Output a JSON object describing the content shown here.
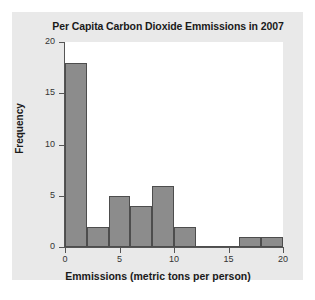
{
  "chart_data": {
    "type": "bar",
    "title": "Per Capita Carbon Dioxide Emmissions in 2007",
    "xlabel": "Emmissions (metric tons per person)",
    "ylabel": "Frequency",
    "xlim": [
      0,
      20
    ],
    "ylim": [
      0,
      20
    ],
    "grid": false,
    "legend": null,
    "bin_width": 2,
    "bin_edges": [
      0,
      2,
      4,
      6,
      8,
      10,
      12,
      14,
      16,
      18,
      20
    ],
    "categories": [
      "0-2",
      "2-4",
      "4-6",
      "6-8",
      "8-10",
      "10-12",
      "12-14",
      "14-16",
      "16-18",
      "18-20"
    ],
    "values": [
      18,
      2,
      5,
      4,
      6,
      2,
      0,
      0,
      1,
      1
    ],
    "xticks": [
      "0",
      "5",
      "10",
      "15",
      "20"
    ],
    "xtick_values": [
      0,
      5,
      10,
      15,
      20
    ],
    "yticks": [
      "0",
      "5",
      "10",
      "15",
      "20"
    ],
    "ytick_values": [
      0,
      5,
      10,
      15,
      20
    ],
    "bar_color": "#8c8c8c",
    "bar_edge_color": "#4d4d4d",
    "plot_background": "#ffffff",
    "panel_background": "#e9e9e9",
    "axis_color": "#555555"
  }
}
